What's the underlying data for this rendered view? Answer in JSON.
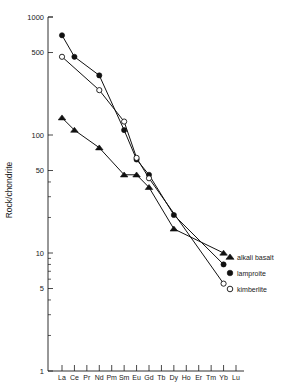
{
  "chart_data": {
    "type": "line",
    "title": "",
    "xlabel": "",
    "ylabel": "Rock/chondrite",
    "scale": "log",
    "ylim": [
      1,
      1000
    ],
    "grid": false,
    "legend_position": "right-inside",
    "categories": [
      "La",
      "Ce",
      "Pr",
      "Nd",
      "Pm",
      "Sm",
      "Eu",
      "Gd",
      "Tb",
      "Dy",
      "Ho",
      "Er",
      "Tm",
      "Yb",
      "Lu"
    ],
    "ytick_labels": [
      "1000",
      "500",
      "100",
      "50",
      "10",
      "5",
      "1"
    ],
    "ytick_values": [
      1000,
      500,
      100,
      50,
      10,
      5,
      1
    ],
    "yminor_values": [
      40,
      30,
      20,
      9,
      8,
      7,
      6,
      4,
      3,
      2
    ],
    "series": [
      {
        "name": "lamproite",
        "marker": "filled-circle",
        "x": [
          "La",
          "Ce",
          "Nd",
          "Sm",
          "Eu",
          "Gd",
          "Dy",
          "Yb"
        ],
        "values": [
          700,
          460,
          320,
          110,
          62,
          46,
          21,
          8
        ]
      },
      {
        "name": "kimberlite",
        "marker": "open-circle",
        "x": [
          "La",
          "Nd",
          "Sm",
          "Eu",
          "Gd",
          "Yb"
        ],
        "values": [
          460,
          240,
          130,
          64,
          43,
          5.5
        ]
      },
      {
        "name": "alkali basalt",
        "marker": "filled-triangle",
        "x": [
          "La",
          "Ce",
          "Nd",
          "Sm",
          "Eu",
          "Gd",
          "Dy",
          "Yb"
        ],
        "values": [
          140,
          110,
          78,
          46,
          46,
          36,
          16,
          10
        ]
      }
    ],
    "legend": [
      {
        "label": "alkali basalt",
        "marker": "filled-triangle"
      },
      {
        "label": "lamproite",
        "marker": "filled-circle"
      },
      {
        "label": "kimberlite",
        "marker": "open-circle"
      }
    ]
  }
}
